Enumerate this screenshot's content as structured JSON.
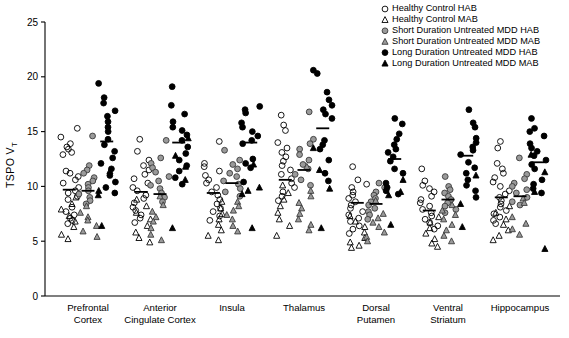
{
  "chart_data": {
    "type": "scatter",
    "title": "",
    "xlabel": "",
    "ylabel": "TSPO VT",
    "ylabel_main": "TSPO V",
    "ylabel_sub": "T",
    "ylim": [
      0,
      25
    ],
    "yticks": [
      0,
      5,
      10,
      15,
      20,
      25
    ],
    "grid": false,
    "legend_position": "top-right",
    "categories": [
      "Prefrontal Cortex",
      "Anterior Cingulate Cortex",
      "Insula",
      "Thalamus",
      "Dorsal Putamen",
      "Ventral Striatum",
      "Hippocampus"
    ],
    "category_lines": [
      [
        "Prefrontal",
        "Cortex"
      ],
      [
        "Anterior",
        "Cingulate Cortex"
      ],
      [
        "Insula",
        ""
      ],
      [
        "Thalamus",
        ""
      ],
      [
        "Dorsal",
        "Putamen"
      ],
      [
        "Ventral",
        "Striatum"
      ],
      [
        "Hippocampus",
        ""
      ]
    ],
    "series": [
      {
        "name": "Healthy Control HAB",
        "marker": "open-circle",
        "fill": "none",
        "stroke": "#000000",
        "shape": "circle"
      },
      {
        "name": "Healthy Control MAB",
        "marker": "open-triangle",
        "fill": "none",
        "stroke": "#000000",
        "shape": "triangle"
      },
      {
        "name": "Short Duration Untreated MDD HAB",
        "marker": "gray-circle",
        "fill": "#9a9a9a",
        "stroke": "#3a3a3a",
        "shape": "circle"
      },
      {
        "name": "Short Duration Untreated MDD MAB",
        "marker": "gray-triangle",
        "fill": "#9a9a9a",
        "stroke": "#3a3a3a",
        "shape": "triangle"
      },
      {
        "name": "Long Duration Untreated MDD HAB",
        "marker": "black-circle",
        "fill": "#000000",
        "stroke": "#000000",
        "shape": "circle"
      },
      {
        "name": "Long Duration Untreated MDD MAB",
        "marker": "black-triangle",
        "fill": "#000000",
        "stroke": "#000000",
        "shape": "triangle"
      }
    ],
    "groups": [
      {
        "category": "Prefrontal Cortex",
        "columns": [
          {
            "series": 0,
            "values": [
              15.3,
              14.5,
              13.9,
              13.6,
              13.4,
              13.1,
              12.9,
              11.4,
              11.2,
              10.9,
              10.6,
              10.3,
              9.9,
              9.6,
              9.4,
              9.1,
              8.8,
              8.1,
              7.7,
              7.4,
              7.1,
              6.9,
              6.6
            ],
            "median": 9.7,
            "mab_values": [
              9.0,
              8.4,
              7.9,
              7.3,
              6.8,
              6.3,
              5.6,
              5.2
            ]
          },
          {
            "series": 2,
            "values": [
              14.6,
              11.9,
              11.5,
              11.2,
              10.8,
              10.5,
              10.2,
              9.9,
              9.6,
              9.3,
              9.0,
              8.7,
              8.4
            ],
            "median": 9.6,
            "mab_values": [
              8.2,
              7.6,
              7.2,
              6.9,
              6.4,
              5.9,
              5.4
            ]
          },
          {
            "series": 4,
            "values": [
              19.4,
              18.1,
              17.6,
              16.9,
              16.4,
              15.9,
              15.4,
              15.0,
              14.3,
              13.8,
              13.2,
              12.6,
              12.1,
              11.6,
              11.0,
              10.4,
              9.9,
              9.4
            ],
            "median": 14.1,
            "mab_values": [
              11.4,
              9.6,
              9.2,
              6.4
            ]
          }
        ]
      },
      {
        "category": "Anterior Cingulate Cortex",
        "columns": [
          {
            "series": 0,
            "values": [
              14.3,
              13.2,
              12.4,
              11.9,
              11.5,
              11.1,
              10.7,
              10.3,
              9.9,
              9.6,
              9.2,
              8.9,
              8.5,
              8.1,
              7.8,
              7.4,
              7.1,
              6.7
            ],
            "median": 9.5,
            "mab_values": [
              8.8,
              8.2,
              7.6,
              7.0,
              6.4,
              5.8,
              5.3,
              4.9
            ]
          },
          {
            "series": 2,
            "values": [
              14.2,
              12.6,
              12.1,
              11.7,
              11.3,
              10.9,
              10.5,
              10.1,
              9.8,
              9.4,
              9.0,
              8.6
            ],
            "median": 9.3,
            "mab_values": [
              9.1,
              8.3,
              7.7,
              7.2,
              6.8,
              6.2,
              5.6,
              5.1
            ]
          },
          {
            "series": 4,
            "values": [
              19.1,
              17.4,
              16.6,
              15.9,
              15.4,
              15.1,
              14.7,
              14.2,
              13.6,
              13.0,
              12.4,
              11.9,
              11.4,
              10.8,
              10.2
            ],
            "median": 14.0,
            "mab_values": [
              14.4,
              12.8,
              11.8,
              10.6,
              6.2
            ]
          }
        ]
      },
      {
        "category": "Insula",
        "columns": [
          {
            "series": 0,
            "values": [
              14.1,
              12.1,
              11.8,
              11.4,
              11.0,
              10.6,
              10.3,
              9.9,
              9.5,
              9.2,
              8.8,
              8.4,
              8.0,
              7.7,
              7.3,
              6.9
            ],
            "median": 9.4,
            "mab_values": [
              8.6,
              8.0,
              7.5,
              7.0,
              6.5,
              6.0,
              5.5,
              5.1
            ]
          },
          {
            "series": 2,
            "values": [
              13.3,
              12.4,
              12.0,
              11.6,
              11.2,
              10.9,
              10.5,
              10.2,
              9.8,
              9.5,
              9.1
            ],
            "median": 10.3,
            "mab_values": [
              8.6,
              8.2,
              7.8,
              7.4,
              7.0,
              6.4,
              5.9
            ]
          },
          {
            "series": 4,
            "values": [
              17.3,
              17.0,
              16.7,
              15.8,
              15.4,
              15.0,
              14.6,
              14.2,
              13.9,
              12.5,
              12.1,
              11.7,
              10.4
            ],
            "median": 14.0,
            "mab_values": [
              12.0,
              9.9,
              9.6,
              9.3,
              6.2
            ]
          }
        ]
      },
      {
        "category": "Thalamus",
        "columns": [
          {
            "series": 0,
            "values": [
              16.5,
              15.6,
              15.1,
              14.0,
              13.5,
              13.1,
              12.7,
              12.3,
              11.9,
              11.5,
              11.1,
              10.7,
              10.3,
              9.9,
              9.5,
              9.1,
              8.7
            ],
            "median": 10.6,
            "mab_values": [
              10.1,
              9.4,
              8.8,
              8.2,
              7.6,
              7.0,
              6.4,
              5.5
            ]
          },
          {
            "series": 2,
            "values": [
              16.8,
              14.3,
              13.9,
              13.4,
              12.9,
              12.4,
              12.0,
              11.6,
              11.1,
              10.6,
              10.1
            ],
            "median": 11.5,
            "mab_values": [
              11.8,
              9.6,
              9.1,
              8.5,
              8.0,
              7.5,
              7.0,
              6.5,
              6.0
            ]
          },
          {
            "series": 4,
            "values": [
              20.6,
              20.3,
              18.6,
              17.9,
              17.4,
              17.0,
              16.6,
              16.2,
              14.2,
              13.8,
              13.4,
              12.4,
              11.2,
              10.5
            ],
            "median": 15.3,
            "mab_values": [
              13.5,
              11.5,
              9.8,
              6.2
            ]
          }
        ]
      },
      {
        "category": "Dorsal Putamen",
        "columns": [
          {
            "series": 0,
            "values": [
              11.8,
              10.6,
              10.2,
              9.9,
              9.5,
              9.2,
              8.9,
              8.6,
              8.3,
              8.0,
              7.7,
              7.4,
              7.1,
              6.8,
              6.4,
              6.1,
              5.7
            ],
            "median": 8.5,
            "mab_values": [
              7.3,
              6.8,
              6.3,
              5.8,
              5.3,
              4.9,
              4.6,
              4.4
            ]
          },
          {
            "series": 2,
            "values": [
              10.3,
              9.9,
              9.5,
              9.2,
              8.9,
              8.6,
              8.3,
              8.0,
              7.7,
              7.4,
              7.0
            ],
            "median": 8.4,
            "mab_values": [
              8.7,
              7.5,
              7.1,
              6.7,
              6.3,
              5.8,
              5.4,
              5.0
            ]
          },
          {
            "series": 4,
            "values": [
              16.2,
              15.7,
              14.8,
              14.3,
              13.8,
              13.4,
              13.1,
              12.7,
              12.3,
              11.6,
              11.2,
              10.3,
              9.9,
              9.6,
              9.3
            ],
            "median": 12.5,
            "mab_values": [
              10.6,
              9.5,
              9.2,
              6.5
            ]
          }
        ]
      },
      {
        "category": "Ventral Striatum",
        "columns": [
          {
            "series": 0,
            "values": [
              11.6,
              10.5,
              10.1,
              9.8,
              9.5,
              9.1,
              8.8,
              8.5,
              8.2,
              7.9,
              7.6,
              7.3,
              7.0,
              6.7,
              6.4,
              6.1
            ],
            "median": 7.8,
            "mab_values": [
              7.2,
              6.7,
              6.2,
              5.7,
              5.2,
              4.8,
              4.5
            ]
          },
          {
            "series": 2,
            "values": [
              10.9,
              10.0,
              9.7,
              9.4,
              9.1,
              8.8,
              8.5,
              8.2,
              7.9,
              7.6
            ],
            "median": 8.8,
            "mab_values": [
              8.3,
              7.8,
              7.4,
              7.0,
              6.5,
              6.0,
              5.5,
              5.0
            ]
          },
          {
            "series": 4,
            "values": [
              17.0,
              15.8,
              15.4,
              14.4,
              14.0,
              13.6,
              13.3,
              12.9,
              12.2,
              11.7,
              11.2,
              10.6,
              10.1,
              9.6,
              9.0
            ],
            "median": 12.8,
            "mab_values": [
              11.0,
              8.4,
              6.3
            ]
          }
        ]
      },
      {
        "category": "Hippocampus",
        "columns": [
          {
            "series": 0,
            "values": [
              14.1,
              13.5,
              12.1,
              11.6,
              11.2,
              10.8,
              10.4,
              10.0,
              9.6,
              9.3,
              9.0,
              8.7,
              8.4,
              8.1,
              7.8,
              7.5,
              7.2,
              6.9,
              6.6
            ],
            "median": 9.0,
            "mab_values": [
              8.2,
              7.6,
              7.0,
              6.5,
              6.0,
              5.5,
              5.1
            ]
          },
          {
            "series": 2,
            "values": [
              12.6,
              11.1,
              10.7,
              10.3,
              10.0,
              9.7,
              9.4,
              9.0,
              8.6,
              8.3
            ],
            "median": 9.1,
            "mab_values": [
              8.9,
              8.5,
              7.2,
              6.6,
              6.1,
              5.6
            ]
          },
          {
            "series": 4,
            "values": [
              16.2,
              15.3,
              15.0,
              14.6,
              13.9,
              13.5,
              13.2,
              12.8,
              12.4,
              12.0,
              11.6,
              10.6,
              10.2,
              9.8,
              9.4
            ],
            "median": 12.2,
            "mab_values": [
              12.9,
              11.3,
              9.5,
              4.3
            ]
          }
        ]
      }
    ]
  },
  "legend": {
    "items": [
      {
        "label": "Healthy Control HAB",
        "marker": "open-circle"
      },
      {
        "label": "Healthy Control MAB",
        "marker": "open-triangle"
      },
      {
        "label": "Short Duration Untreated MDD HAB",
        "marker": "gray-circle"
      },
      {
        "label": "Short Duration Untreated MDD MAB",
        "marker": "gray-triangle"
      },
      {
        "label": "Long Duration Untreated MDD HAB",
        "marker": "black-circle"
      },
      {
        "label": "Long Duration Untreated MDD MAB",
        "marker": "black-triangle"
      }
    ]
  },
  "colors": {
    "axis": "#000000",
    "open_marker_stroke": "#000000",
    "gray_marker_fill": "#9a9a9a",
    "gray_marker_stroke": "#3a3a3a",
    "black_marker_fill": "#000000",
    "background": "#ffffff"
  }
}
